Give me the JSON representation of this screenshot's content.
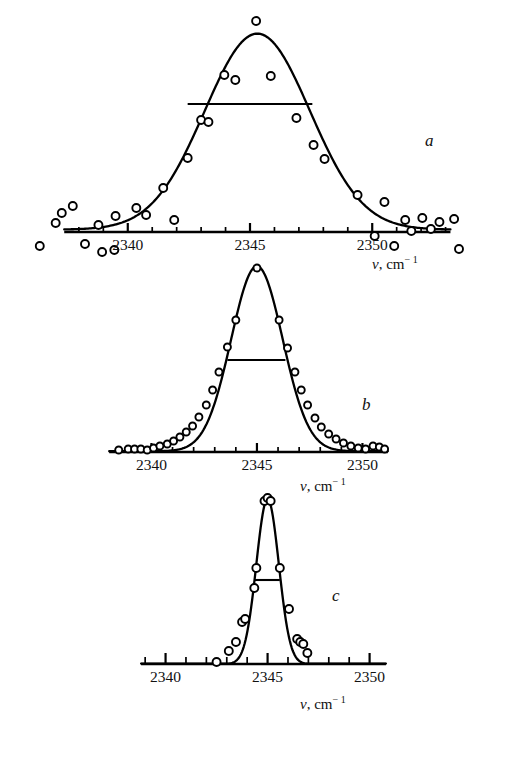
{
  "figure": {
    "background": "#ffffff",
    "ink": "#000000",
    "width": 507,
    "height": 768
  },
  "axis_label_text": {
    "symbol": "v",
    "separator": ", cm",
    "exponent": "− 1"
  },
  "panels": [
    {
      "id": "a",
      "letter": "a",
      "letter_x": 425,
      "letter_y": 131,
      "axis_y": 232,
      "x0_px": 30,
      "x1_px": 470,
      "x_min": 2336.0,
      "x_max": 2354.0,
      "baseline_from": 2337.4,
      "baseline_to": 2353.2,
      "peak_height_px": 196,
      "tick_labels": [
        2340,
        2345,
        2350
      ],
      "tick_label_y": 236,
      "minor_tick_len": 5,
      "major_tick_len": 9,
      "tick_step": 1,
      "tick_first": 2338,
      "tick_last": 2353,
      "axis_label_x": 372,
      "axis_label_y": 254,
      "fwhm": {
        "from": 2342.45,
        "to": 2347.55,
        "y_px": 128
      },
      "curve_center": 2345.3,
      "curve_sigma": 2.15,
      "curve_baseline_frac": 0.012,
      "noise": true,
      "signal_points": [
        {
          "x": 2338.8,
          "y": 7
        },
        {
          "x": 2339.5,
          "y": 16
        },
        {
          "x": 2340.35,
          "y": 24
        },
        {
          "x": 2340.75,
          "y": 17
        },
        {
          "x": 2341.45,
          "y": 44
        },
        {
          "x": 2342.45,
          "y": 74
        },
        {
          "x": 2343.0,
          "y": 112
        },
        {
          "x": 2343.3,
          "y": 110
        },
        {
          "x": 2343.95,
          "y": 157
        },
        {
          "x": 2344.4,
          "y": 152
        },
        {
          "x": 2345.25,
          "y": 211
        },
        {
          "x": 2345.85,
          "y": 156
        },
        {
          "x": 2346.9,
          "y": 114
        },
        {
          "x": 2347.6,
          "y": 87
        },
        {
          "x": 2348.05,
          "y": 73
        },
        {
          "x": 2349.4,
          "y": 37
        },
        {
          "x": 2350.5,
          "y": 30
        },
        {
          "x": 2351.35,
          "y": 12
        },
        {
          "x": 2352.4,
          "y": 3
        }
      ],
      "noise_points": [
        {
          "x": 2336.4,
          "y": -14
        },
        {
          "x": 2337.3,
          "y": 19
        },
        {
          "x": 2337.75,
          "y": 26
        },
        {
          "x": 2337.05,
          "y": 9
        },
        {
          "x": 2338.25,
          "y": -12
        },
        {
          "x": 2338.95,
          "y": -20
        },
        {
          "x": 2339.45,
          "y": -18
        },
        {
          "x": 2341.9,
          "y": 12
        },
        {
          "x": 2350.1,
          "y": -4
        },
        {
          "x": 2350.9,
          "y": -14
        },
        {
          "x": 2352.05,
          "y": 14
        },
        {
          "x": 2352.75,
          "y": 10
        },
        {
          "x": 2353.35,
          "y": 13
        },
        {
          "x": 2353.55,
          "y": -17
        },
        {
          "x": 2351.6,
          "y": 1
        }
      ]
    },
    {
      "id": "b",
      "letter": "b",
      "letter_x": 362,
      "letter_y": 395,
      "axis_y": 452,
      "x0_px": 105,
      "x1_px": 392,
      "x_min": 2337.8,
      "x_max": 2351.4,
      "baseline_from": 2338.0,
      "baseline_to": 2351.2,
      "peak_height_px": 185,
      "tick_labels": [
        2340,
        2345,
        2350
      ],
      "tick_label_y": 456,
      "minor_tick_len": 5,
      "major_tick_len": 9,
      "tick_step": 1,
      "tick_first": 2339,
      "tick_last": 2351,
      "axis_label_x": 300,
      "axis_label_y": 476,
      "fwhm": {
        "from": 2343.6,
        "to": 2346.35,
        "y_px": 92
      },
      "curve_center": 2345.0,
      "curve_sigma": 1.22,
      "curve_baseline_frac": 0.004,
      "noise": false,
      "signal_points": [
        {
          "x": 2338.45,
          "y": 2
        },
        {
          "x": 2338.9,
          "y": 3
        },
        {
          "x": 2339.2,
          "y": 3
        },
        {
          "x": 2339.5,
          "y": 3
        },
        {
          "x": 2339.8,
          "y": 2
        },
        {
          "x": 2340.1,
          "y": 4
        },
        {
          "x": 2340.4,
          "y": 6
        },
        {
          "x": 2340.75,
          "y": 8
        },
        {
          "x": 2341.05,
          "y": 11
        },
        {
          "x": 2341.35,
          "y": 15
        },
        {
          "x": 2341.65,
          "y": 20
        },
        {
          "x": 2341.95,
          "y": 26
        },
        {
          "x": 2342.25,
          "y": 35
        },
        {
          "x": 2342.6,
          "y": 47
        },
        {
          "x": 2342.9,
          "y": 62
        },
        {
          "x": 2343.2,
          "y": 80
        },
        {
          "x": 2343.6,
          "y": 105
        },
        {
          "x": 2344.0,
          "y": 132
        },
        {
          "x": 2345.0,
          "y": 184
        },
        {
          "x": 2346.05,
          "y": 132
        },
        {
          "x": 2346.45,
          "y": 104
        },
        {
          "x": 2346.8,
          "y": 80
        },
        {
          "x": 2347.1,
          "y": 62
        },
        {
          "x": 2347.4,
          "y": 47
        },
        {
          "x": 2347.75,
          "y": 34
        },
        {
          "x": 2348.05,
          "y": 25
        },
        {
          "x": 2348.4,
          "y": 18
        },
        {
          "x": 2348.75,
          "y": 13
        },
        {
          "x": 2349.1,
          "y": 9
        },
        {
          "x": 2349.45,
          "y": 6
        },
        {
          "x": 2349.8,
          "y": 4
        },
        {
          "x": 2350.15,
          "y": 3
        },
        {
          "x": 2350.5,
          "y": 6
        },
        {
          "x": 2350.8,
          "y": 5
        },
        {
          "x": 2351.05,
          "y": 3
        }
      ],
      "noise_points": []
    },
    {
      "id": "c",
      "letter": "c",
      "letter_x": 332,
      "letter_y": 586,
      "axis_y": 664,
      "x0_px": 137,
      "x1_px": 390,
      "x_min": 2338.6,
      "x_max": 2351.0,
      "baseline_from": 2338.8,
      "baseline_to": 2350.8,
      "peak_height_px": 165,
      "tick_labels": [
        2340,
        2345,
        2350
      ],
      "tick_label_y": 668,
      "minor_tick_len": 7,
      "major_tick_len": 11,
      "tick_step": 1,
      "tick_first": 2339,
      "tick_last": 2350,
      "axis_label_x": 300,
      "axis_label_y": 694,
      "fwhm": {
        "from": 2344.35,
        "to": 2345.6,
        "y_px": 84
      },
      "curve_center": 2345.0,
      "curve_sigma": 0.55,
      "curve_baseline_frac": 0.0,
      "noise": false,
      "signal_points": [
        {
          "x": 2342.5,
          "y": 2
        },
        {
          "x": 2343.1,
          "y": 13
        },
        {
          "x": 2343.45,
          "y": 22
        },
        {
          "x": 2343.75,
          "y": 42
        },
        {
          "x": 2343.9,
          "y": 45
        },
        {
          "x": 2344.35,
          "y": 76
        },
        {
          "x": 2344.45,
          "y": 96
        },
        {
          "x": 2344.85,
          "y": 163
        },
        {
          "x": 2345.0,
          "y": 166
        },
        {
          "x": 2345.15,
          "y": 163
        },
        {
          "x": 2345.6,
          "y": 96
        },
        {
          "x": 2346.05,
          "y": 55
        },
        {
          "x": 2346.45,
          "y": 25
        },
        {
          "x": 2346.6,
          "y": 22
        },
        {
          "x": 2346.75,
          "y": 20
        },
        {
          "x": 2346.95,
          "y": 11
        }
      ],
      "noise_points": []
    }
  ],
  "chart_data": {
    "type": "scatter",
    "title": "",
    "xlabel": "v, cm-1",
    "ylabel": "",
    "xlim": [
      2336,
      2354
    ],
    "grid": false,
    "legend": "none",
    "panel_count": 3,
    "panels": [
      {
        "label": "a",
        "description": "Broad noisy spectral line, open circles with fitted Gaussian and horizontal FWHM bar",
        "peak_center": 2345.3,
        "fwhm_cm1": 5.1,
        "xticks": [
          2340,
          2345,
          2350
        ],
        "x": [
          2338.8,
          2339.5,
          2340.35,
          2340.75,
          2341.45,
          2342.45,
          2343.0,
          2343.3,
          2343.95,
          2344.4,
          2345.25,
          2345.85,
          2346.9,
          2347.6,
          2348.05,
          2349.4,
          2350.5,
          2351.35,
          2352.4
        ],
        "y": [
          7,
          16,
          24,
          17,
          44,
          74,
          112,
          110,
          157,
          152,
          211,
          156,
          114,
          87,
          73,
          37,
          30,
          12,
          3
        ]
      },
      {
        "label": "b",
        "description": "Narrower, densely sampled spectral line with low noise and horizontal FWHM bar",
        "peak_center": 2345.0,
        "fwhm_cm1": 2.75,
        "xticks": [
          2340,
          2345,
          2350
        ],
        "x": [
          2338.45,
          2339.2,
          2339.8,
          2340.4,
          2341.05,
          2341.65,
          2342.25,
          2342.9,
          2343.6,
          2344.0,
          2345.0,
          2346.05,
          2346.8,
          2347.4,
          2348.05,
          2348.75,
          2349.45,
          2350.15,
          2350.8
        ],
        "y": [
          2,
          3,
          2,
          6,
          11,
          20,
          35,
          62,
          105,
          132,
          184,
          132,
          80,
          47,
          25,
          13,
          6,
          3,
          5
        ]
      },
      {
        "label": "c",
        "description": "Narrowest spectral line, sharply peaked with horizontal FWHM bar",
        "peak_center": 2345.0,
        "fwhm_cm1": 1.25,
        "xticks": [
          2340,
          2345,
          2350
        ],
        "x": [
          2342.5,
          2343.1,
          2343.45,
          2343.9,
          2344.35,
          2344.85,
          2345.0,
          2345.15,
          2345.6,
          2346.05,
          2346.45,
          2346.75,
          2346.95
        ],
        "y": [
          2,
          13,
          22,
          45,
          76,
          163,
          166,
          163,
          96,
          55,
          25,
          20,
          11
        ]
      }
    ]
  }
}
